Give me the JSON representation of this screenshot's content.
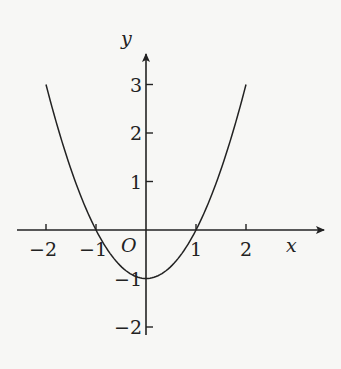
{
  "chart_data": {
    "type": "line",
    "title": "",
    "function": "y = x^2 - 1",
    "xlabel": "x",
    "ylabel": "y",
    "origin_label": "O",
    "xlim": [
      -2.5,
      3.6
    ],
    "ylim": [
      -2.5,
      3.6
    ],
    "x_ticks": [
      -2,
      -1,
      1,
      2
    ],
    "x_tick_labels": [
      "−2",
      "−1",
      "1",
      "2"
    ],
    "y_ticks": [
      -2,
      -1,
      1,
      2,
      3
    ],
    "y_tick_labels": [
      "−2",
      "−1",
      "1",
      "2",
      "3"
    ],
    "grid": false,
    "series": [
      {
        "name": "parabola",
        "x": [
          -2,
          -1.5,
          -1,
          -0.5,
          0,
          0.5,
          1,
          1.5,
          2
        ],
        "y": [
          3,
          1.25,
          0,
          -0.75,
          -1,
          -0.75,
          0,
          1.25,
          3
        ]
      }
    ],
    "colors": {
      "line": "#222222",
      "background": "#f7f7f5"
    }
  }
}
